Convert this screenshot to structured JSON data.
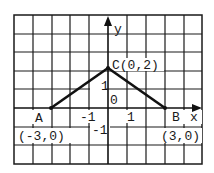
{
  "diagram": {
    "type": "coordinate-grid-triangle",
    "grid": {
      "columns": 10,
      "rows": 8,
      "unit_px": 19
    },
    "axes": {
      "x_label": "x",
      "y_label": "y",
      "origin_label": "0"
    },
    "ticks": {
      "x_neg1": "-1",
      "x_pos1": "1",
      "y_pos1": "1",
      "y_neg1": "-1"
    },
    "points": [
      {
        "name": "A",
        "coord_label": "(-3,0)",
        "x": -3,
        "y": 0
      },
      {
        "name": "B",
        "coord_label": "(3,0)",
        "x": 3,
        "y": 0
      },
      {
        "name": "C",
        "coord_label": "C(0,2)",
        "x": 0,
        "y": 2
      }
    ],
    "segments": [
      [
        "A",
        "C"
      ],
      [
        "C",
        "B"
      ]
    ],
    "colors": {
      "grid": "#1a1a1a",
      "line": "#111111",
      "background": "#ffffff"
    }
  }
}
